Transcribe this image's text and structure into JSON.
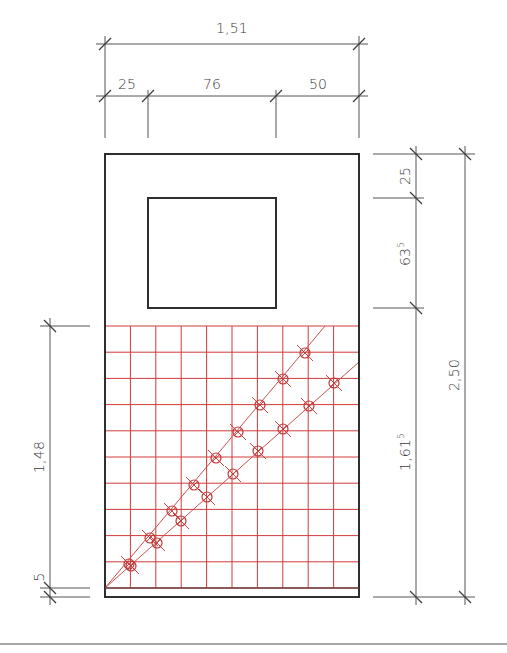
{
  "colors": {
    "outline": "#2e2e2e",
    "dimension": "#555555",
    "grid": "#d23a3a",
    "diagonal": "#c85050",
    "marker": "#c43535",
    "rule": "#8a8a8a"
  },
  "wall": {
    "outer": {
      "x": 105,
      "y": 154,
      "w": 254,
      "h": 443
    },
    "window": {
      "x": 148,
      "y": 198,
      "w": 128,
      "h": 110
    },
    "base_line_y": 588
  },
  "grid": {
    "x0": 105,
    "x1": 359,
    "y0": 326,
    "y1": 588,
    "cols": 10,
    "rows": 10
  },
  "diagonals": [
    {
      "name": "upper",
      "x1": 105,
      "y1": 588,
      "x2": 325,
      "y2": 326
    },
    {
      "name": "lower",
      "x1": 105,
      "y1": 588,
      "x2": 359,
      "y2": 362
    }
  ],
  "markers": [
    {
      "x": 129,
      "y": 564
    },
    {
      "x": 150,
      "y": 538
    },
    {
      "x": 172,
      "y": 511
    },
    {
      "x": 194,
      "y": 485
    },
    {
      "x": 216,
      "y": 458
    },
    {
      "x": 238,
      "y": 432
    },
    {
      "x": 260,
      "y": 405
    },
    {
      "x": 283,
      "y": 379
    },
    {
      "x": 305,
      "y": 353
    },
    {
      "x": 131,
      "y": 566
    },
    {
      "x": 157,
      "y": 543
    },
    {
      "x": 181,
      "y": 521
    },
    {
      "x": 207,
      "y": 497
    },
    {
      "x": 233,
      "y": 474
    },
    {
      "x": 258,
      "y": 451
    },
    {
      "x": 283,
      "y": 429
    },
    {
      "x": 309,
      "y": 406
    },
    {
      "x": 334,
      "y": 383
    }
  ],
  "dimensions": {
    "total_width": {
      "label": "1,51"
    },
    "segments_top": [
      {
        "label": "25"
      },
      {
        "label": "76"
      },
      {
        "label": "50"
      }
    ],
    "right_inner": [
      {
        "label": "25",
        "sup": ""
      },
      {
        "label": "63",
        "sup": "5"
      },
      {
        "label": "1,61",
        "sup": "5"
      }
    ],
    "right_outer": {
      "label": "2,50"
    },
    "left": [
      {
        "label": "1,48"
      },
      {
        "label": "5"
      }
    ]
  }
}
